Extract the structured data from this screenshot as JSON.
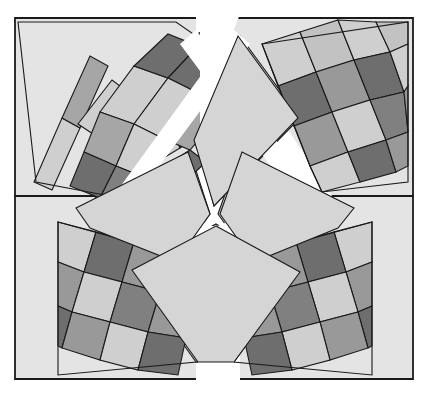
{
  "figure": {
    "canvas": {
      "width": 428,
      "height": 397
    },
    "background_color": "#ffffff",
    "gap_color": "#ffffff",
    "outline_color": "#1a1a1a",
    "panel_fill": "#e4e4e4",
    "center_fill": "#d5d5d5",
    "palette": {
      "light": "#cfcfcf",
      "light2": "#c2c2c2",
      "medium": "#a6a6a6",
      "medium2": "#999999",
      "dark": "#808080",
      "darkest": "#6e6e6e"
    },
    "frames": [
      {
        "name": "frame-top-left",
        "points": "15,18 214,18 214,150 110,196 15,196"
      },
      {
        "name": "frame-top-right",
        "points": "214,18 413,18 413,196 318,196 214,150"
      },
      {
        "name": "frame-bottom-left",
        "points": "15,196 110,196 214,243 214,379 15,379"
      },
      {
        "name": "frame-bottom-right",
        "points": "214,243 318,196 413,196 413,379 214,379"
      }
    ],
    "panels": [
      {
        "name": "panel-top-left",
        "quadrant": "top-left",
        "outline": "18,22 176,22 228,58 120,196 36,180",
        "rows": 3,
        "cols": 4,
        "tilt": "left-leaning"
      },
      {
        "name": "panel-top-right",
        "quadrant": "top-right",
        "outline": "252,32 408,22 408,182 310,196 252,160",
        "rows": 3,
        "cols": 4,
        "tilt": "right-leaning"
      },
      {
        "name": "panel-bottom-left",
        "quadrant": "bottom-left",
        "outline": "58,218 160,232 218,360 58,375",
        "rows": 3,
        "cols": 4,
        "tilt": "right-leaning"
      },
      {
        "name": "panel-bottom-right",
        "quadrant": "bottom-right",
        "outline": "268,232 372,218 372,375 212,360",
        "rows": 3,
        "cols": 4,
        "tilt": "left-leaning"
      }
    ],
    "center_kites": [
      {
        "name": "center-kite-top",
        "points": "240,36 196,140 214,206 300,118 272,36"
      },
      {
        "name": "center-kite-left",
        "points": "74,206 186,154 212,214 178,260 92,226"
      },
      {
        "name": "center-kite-right",
        "points": "356,206 242,152 214,214 250,262 336,228"
      },
      {
        "name": "center-kite-bottom",
        "points": "214,222 302,272 234,364 196,364 128,270"
      }
    ],
    "checker_sequence": [
      [
        "light",
        "darkest",
        "medium",
        "darkest"
      ],
      [
        "medium",
        "light",
        "dark",
        "medium"
      ],
      [
        "darkest",
        "medium",
        "light",
        "darkest"
      ]
    ]
  },
  "labels": {
    "figure_caption": ""
  }
}
